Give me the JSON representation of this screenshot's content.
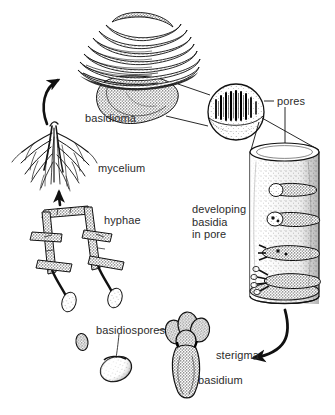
{
  "figure": {
    "background_color": "#ffffff",
    "ink_color": "#1a1a1a",
    "text_color": "#2b2b2b",
    "width": 335,
    "height": 415
  },
  "labels": {
    "basidioma": "basidioma",
    "mycelium": "mycelium",
    "hyphae": "hyphae",
    "pores": "pores",
    "developing_basidia_in_pore": "developing\nbasidia\nin pore",
    "basidiospores": "basidiospores",
    "sterigma": "sterigma",
    "basidium": "basidium"
  },
  "structures": [
    {
      "name": "basidioma",
      "description": "layered bracket fungus fruiting body"
    },
    {
      "name": "mycelium",
      "description": "branching root-like hyphal mass"
    },
    {
      "name": "hyphae",
      "description": "septate branching filaments with clamp connections"
    },
    {
      "name": "pore-magnifier",
      "description": "circular magnified inset showing vertical pore tubes"
    },
    {
      "name": "pore-cylinder",
      "description": "cut-away cylinder of a single pore with developing basidia"
    },
    {
      "name": "basidiospores",
      "description": "two detached ovoid spores"
    },
    {
      "name": "basidium",
      "description": "club-shaped cell bearing four spores on sterigmata"
    }
  ],
  "connectors": [
    {
      "name": "mycelium-to-basidioma-arrow",
      "from": "mycelium",
      "to": "basidioma"
    },
    {
      "name": "hyphae-to-mycelium-arrow",
      "from": "hyphae",
      "to": "mycelium"
    },
    {
      "name": "basidioma-to-magnifier-leaders",
      "from": "basidioma",
      "to": "pore-magnifier"
    },
    {
      "name": "magnifier-to-cylinder-leaders",
      "from": "pore-magnifier",
      "to": "pore-cylinder"
    },
    {
      "name": "pores-leader",
      "from": "pores",
      "to": "pore-cylinder"
    },
    {
      "name": "cylinder-to-basidium-arrow",
      "from": "pore-cylinder",
      "to": "basidium"
    },
    {
      "name": "basidiospores-leaders",
      "from": "basidiospores",
      "to": "basidiospores"
    }
  ]
}
